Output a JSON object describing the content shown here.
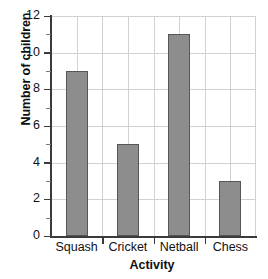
{
  "chart_data": {
    "type": "bar",
    "title": "",
    "categories": [
      "Squash",
      "Cricket",
      "Netball",
      "Chess"
    ],
    "values": [
      9,
      5,
      11,
      3
    ],
    "xlabel": "Activity",
    "ylabel": "Number of children",
    "ylim": [
      0,
      12
    ],
    "ytick_labels": [
      "0",
      "2",
      "4",
      "6",
      "8",
      "10",
      "12"
    ],
    "ytick_values": [
      0,
      2,
      4,
      6,
      8,
      10,
      12
    ],
    "yminor_values": [
      1,
      3,
      5,
      7,
      9,
      11
    ],
    "grid": true,
    "legend": "none",
    "bar_color": "#8d8d8d",
    "bar_edge_color": "#565656",
    "grid_color": "#d2d2d2",
    "axis_color": "#3b3b3b"
  }
}
